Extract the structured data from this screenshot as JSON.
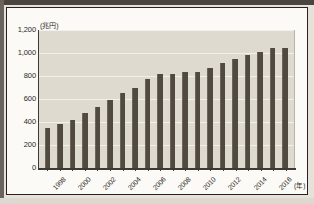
{
  "chart_data": {
    "type": "bar",
    "title": "",
    "xlabel": "年",
    "ylabel": "兆円",
    "unit_label_y": "(兆円)",
    "unit_label_x": "(年)",
    "ylim": [
      0,
      1200
    ],
    "ytick_values": [
      1200,
      1000,
      800,
      600,
      400,
      200,
      0
    ],
    "ytick_labels": [
      "1,200",
      "1,000",
      "800",
      "600",
      "400",
      "200",
      "0"
    ],
    "grid": true,
    "legend": "none",
    "categories": [
      "1997",
      "1998",
      "1999",
      "2000",
      "2001",
      "2002",
      "2003",
      "2004",
      "2005",
      "2006",
      "2007",
      "2008",
      "2009",
      "2010",
      "2011",
      "2012",
      "2013",
      "2014",
      "2015",
      "2016"
    ],
    "xtick_labels_shown": [
      "",
      "1998",
      "",
      "2000",
      "",
      "2002",
      "",
      "2004",
      "",
      "2006",
      "",
      "2008",
      "",
      "2010",
      "",
      "2012",
      "",
      "2014",
      "",
      "2016"
    ],
    "values": [
      345,
      380,
      420,
      475,
      530,
      590,
      655,
      695,
      770,
      815,
      815,
      835,
      835,
      870,
      910,
      945,
      980,
      1010,
      1045,
      1040
    ],
    "bar_color": "#514a40",
    "plot_background": "#dedad0"
  },
  "frame": {
    "border_color": "#27231f",
    "page_background": "#e6e2d9"
  }
}
